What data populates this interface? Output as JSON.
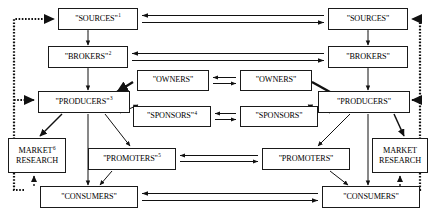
{
  "diagram": {
    "type": "flow-diagram",
    "line_color": "#111111",
    "box_fill": "#ffffff",
    "columns": [
      "left-market",
      "center",
      "right-market"
    ],
    "nodes": [
      {
        "id": "sources-left",
        "label": "\"SOURCES\"",
        "note": "1",
        "x": 58,
        "y": 8,
        "w": 80,
        "h": 22
      },
      {
        "id": "sources-right",
        "label": "\"SOURCES\"",
        "note": "",
        "x": 328,
        "y": 8,
        "w": 80,
        "h": 22
      },
      {
        "id": "brokers-left",
        "label": "\"BROKERS\"",
        "note": "2",
        "x": 48,
        "y": 46,
        "w": 80,
        "h": 22
      },
      {
        "id": "brokers-right",
        "label": "\"BROKERS\"",
        "note": "",
        "x": 328,
        "y": 46,
        "w": 80,
        "h": 22
      },
      {
        "id": "owners-left",
        "label": "\"OWNERS\"",
        "note": "",
        "x": 137,
        "y": 70,
        "w": 72,
        "h": 21
      },
      {
        "id": "owners-right",
        "label": "\"OWNERS\"",
        "note": "",
        "x": 240,
        "y": 70,
        "w": 72,
        "h": 21
      },
      {
        "id": "producers-left",
        "label": "\"PRODUCERS\"",
        "note": "3",
        "x": 38,
        "y": 91,
        "w": 92,
        "h": 22
      },
      {
        "id": "producers-right",
        "label": "\"PRODUCERS\"",
        "note": "",
        "x": 318,
        "y": 91,
        "w": 92,
        "h": 22
      },
      {
        "id": "sponsors-left",
        "label": "\"SPONSORS\"",
        "note": "4",
        "x": 133,
        "y": 106,
        "w": 78,
        "h": 21
      },
      {
        "id": "sponsors-right",
        "label": "\"SPONSORS\"",
        "note": "",
        "x": 240,
        "y": 106,
        "w": 78,
        "h": 21
      },
      {
        "id": "market-research-left",
        "label": "MARKET|RESEARCH",
        "note": "6",
        "x": 8,
        "y": 138,
        "w": 58,
        "h": 35
      },
      {
        "id": "market-research-right",
        "label": "MARKET|RESEARCH",
        "note": "",
        "x": 372,
        "y": 138,
        "w": 56,
        "h": 35
      },
      {
        "id": "promoters-left",
        "label": "\"PROMOTERS\"",
        "note": "5",
        "x": 88,
        "y": 148,
        "w": 88,
        "h": 22
      },
      {
        "id": "promoters-right",
        "label": "\"PROMOTERS\"",
        "note": "",
        "x": 262,
        "y": 148,
        "w": 88,
        "h": 22
      },
      {
        "id": "consumers-left",
        "label": "\"CONSUMERS\"",
        "note": "",
        "x": 40,
        "y": 186,
        "w": 98,
        "h": 22
      },
      {
        "id": "consumers-right",
        "label": "\"CONSUMERS\"",
        "note": "",
        "x": 322,
        "y": 186,
        "w": 98,
        "h": 22
      }
    ],
    "footnote_markers": [
      "1",
      "2",
      "3",
      "4",
      "5",
      "6"
    ]
  }
}
